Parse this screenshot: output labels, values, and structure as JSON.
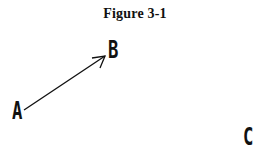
{
  "figure": {
    "title": "Figure 3-1",
    "points": [
      {
        "id": "A",
        "label": "A"
      },
      {
        "id": "B",
        "label": "B"
      },
      {
        "id": "C",
        "label": "C"
      }
    ],
    "arrows": [
      {
        "from": "A",
        "to": "B"
      }
    ],
    "colors": {
      "ink": "#111111",
      "background": "#ffffff"
    }
  }
}
